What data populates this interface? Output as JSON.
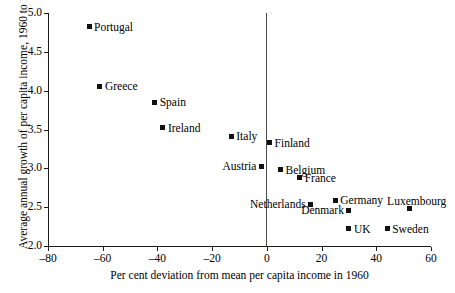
{
  "chart_data": {
    "type": "scatter",
    "title": "",
    "xlabel": "Per cent deviation from mean per capita income in 1960",
    "ylabel": "Average annual growth of per capita income, 1960 to 1990",
    "xlim": [
      -80,
      60
    ],
    "ylim": [
      2.0,
      5.0
    ],
    "xticks": [
      -80,
      -60,
      -40,
      -20,
      0,
      20,
      40,
      60
    ],
    "xtick_labels": [
      "–80",
      "–60",
      "–40",
      "–20",
      "0",
      "20",
      "40",
      "60"
    ],
    "yticks": [
      2.0,
      2.5,
      3.0,
      3.5,
      4.0,
      4.5,
      5.0
    ],
    "ytick_labels": [
      "2.0",
      "2.5",
      "3.0",
      "3.5",
      "4.0",
      "4.5",
      "5.0"
    ],
    "grid": false,
    "legend": false,
    "reference_line_x": 0,
    "marker_color": "#111111",
    "axis_color": "#1a1a1a",
    "points": [
      {
        "label": "Portugal",
        "x": -65,
        "y": 4.82,
        "label_side": "right"
      },
      {
        "label": "Greece",
        "x": -61,
        "y": 4.06,
        "label_side": "right"
      },
      {
        "label": "Spain",
        "x": -41,
        "y": 3.85,
        "label_side": "right"
      },
      {
        "label": "Ireland",
        "x": -38,
        "y": 3.52,
        "label_side": "right"
      },
      {
        "label": "Italy",
        "x": -13,
        "y": 3.41,
        "label_side": "right"
      },
      {
        "label": "Finland",
        "x": 1,
        "y": 3.33,
        "label_side": "right"
      },
      {
        "label": "Austria",
        "x": -2,
        "y": 3.03,
        "label_side": "left"
      },
      {
        "label": "Belgium",
        "x": 5,
        "y": 2.98,
        "label_side": "right"
      },
      {
        "label": "France",
        "x": 12,
        "y": 2.88,
        "label_side": "right"
      },
      {
        "label": "Netherlands",
        "x": 16,
        "y": 2.54,
        "label_side": "left"
      },
      {
        "label": "Germany",
        "x": 25,
        "y": 2.59,
        "label_side": "right"
      },
      {
        "label": "Denmark",
        "x": 30,
        "y": 2.46,
        "label_side": "left"
      },
      {
        "label": "UK",
        "x": 30,
        "y": 2.22,
        "label_side": "right"
      },
      {
        "label": "Sweden",
        "x": 44,
        "y": 2.22,
        "label_side": "right"
      },
      {
        "label": "Luxembourg",
        "x": 52,
        "y": 2.48,
        "label_side": "above"
      }
    ]
  }
}
